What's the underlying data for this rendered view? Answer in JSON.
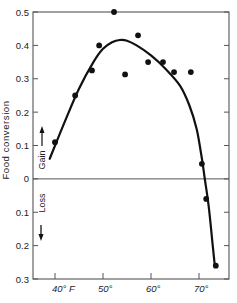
{
  "chart_data": {
    "type": "scatter",
    "title": "",
    "xlabel": "",
    "ylabel": "Food conversion",
    "gain_label": "Gain",
    "loss_label": "Loss",
    "x_ticks": [
      {
        "value": 40,
        "label": "40° F"
      },
      {
        "value": 50,
        "label": "50°"
      },
      {
        "value": 60,
        "label": "60°"
      },
      {
        "value": 70,
        "label": "70°"
      }
    ],
    "y_ticks": [
      {
        "value": 0.5,
        "label": "0.5"
      },
      {
        "value": 0.4,
        "label": "0.4"
      },
      {
        "value": 0.3,
        "label": "0.3"
      },
      {
        "value": 0.2,
        "label": "0.2"
      },
      {
        "value": 0.1,
        "label": "0.1"
      },
      {
        "value": 0.0,
        "label": "0"
      },
      {
        "value": -0.1,
        "label": "0.1"
      },
      {
        "value": -0.2,
        "label": "0.2"
      },
      {
        "value": -0.3,
        "label": "0.3"
      }
    ],
    "xlim": [
      35.5,
      76
    ],
    "ylim": [
      -0.3,
      0.5
    ],
    "grid": false,
    "zero_line": true,
    "series": [
      {
        "name": "observed",
        "kind": "points",
        "x": [
          40,
          44.2,
          47.7,
          49.2,
          52.3,
          54.6,
          57.3,
          59.4,
          62.5,
          64.8,
          68.3,
          70.6,
          71.5,
          73.5
        ],
        "y": [
          0.11,
          0.25,
          0.325,
          0.4,
          0.5,
          0.313,
          0.43,
          0.35,
          0.35,
          0.32,
          0.32,
          0.045,
          -0.06,
          -0.26
        ]
      },
      {
        "name": "fitted curve",
        "kind": "line",
        "x": [
          38.9,
          42,
          45,
          48,
          50,
          52,
          53.5,
          55,
          57,
          60,
          63,
          66,
          68,
          69.5,
          70.5,
          71.2,
          72,
          72.8,
          73.3
        ],
        "y": [
          0.06,
          0.17,
          0.27,
          0.35,
          0.39,
          0.41,
          0.416,
          0.414,
          0.4,
          0.37,
          0.33,
          0.28,
          0.22,
          0.15,
          0.07,
          0.0,
          -0.08,
          -0.19,
          -0.26
        ]
      }
    ]
  },
  "colors": {
    "ink": "#111111",
    "axis": "#555555",
    "background": "#ffffff"
  }
}
